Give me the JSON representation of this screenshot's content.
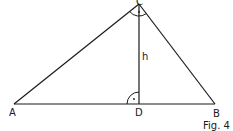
{
  "figure": {
    "caption": "Fig. 4",
    "stroke_color": "#1a1a1a",
    "background": "#ffffff"
  },
  "points": {
    "A": {
      "label": "A",
      "x": 14,
      "y": 104
    },
    "B": {
      "label": "B",
      "x": 215,
      "y": 104
    },
    "C": {
      "label": "C",
      "x": 139,
      "y": 4
    },
    "D": {
      "label": "D",
      "x": 139,
      "y": 104
    }
  },
  "segments": [
    {
      "from": "A",
      "to": "B",
      "name": "side-c"
    },
    {
      "from": "A",
      "to": "C",
      "name": "side-b"
    },
    {
      "from": "B",
      "to": "C",
      "name": "side-a"
    },
    {
      "from": "C",
      "to": "D",
      "name": "altitude-h"
    }
  ],
  "altitude": {
    "label": "h"
  },
  "right_angles": [
    {
      "at": "C",
      "marker": "·"
    },
    {
      "at": "D",
      "marker": "·"
    }
  ]
}
